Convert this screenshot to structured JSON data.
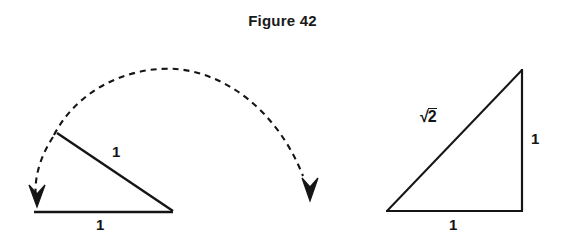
{
  "figure": {
    "title": "Figure 42",
    "background_color": "#ffffff",
    "stroke_color": "#151515",
    "width": 565,
    "height": 247
  },
  "left_diagram": {
    "name": "rotating-unit-segment-diagram",
    "base_label": "1",
    "hypotenuse_label": "1",
    "arc_style": "dashed",
    "arrow_count": 2,
    "arrow_direction": "down",
    "geometry": {
      "base_start_x": 34,
      "base_start_y": 212,
      "base_end_x": 172,
      "base_end_y": 212,
      "slant_start_x": 57,
      "slant_start_y": 133,
      "slant_end_x": 172,
      "slant_end_y": 211,
      "arc_peak_x": 175,
      "arc_peak_y": 70,
      "left_arrow_tip_x": 37,
      "left_arrow_tip_y": 206,
      "right_arrow_tip_x": 310,
      "right_arrow_tip_y": 200
    },
    "labels": [
      {
        "text": "1",
        "x": 112,
        "y": 144,
        "name": "left-hypotenuse-length-label"
      },
      {
        "text": "1",
        "x": 96,
        "y": 217,
        "name": "left-base-length-label"
      }
    ]
  },
  "right_diagram": {
    "name": "right-isosceles-triangle-diagram",
    "base_label": "1",
    "vertical_label": "1",
    "hypotenuse_label": "√2",
    "hypotenuse_radicand": "2",
    "geometry": {
      "left_vertex_x": 387,
      "left_vertex_y": 211,
      "right_vertex_x": 522,
      "right_vertex_y": 211,
      "apex_x": 522,
      "apex_y": 70
    },
    "labels": [
      {
        "text": "1",
        "x": 531,
        "y": 131,
        "name": "right-vertical-length-label"
      },
      {
        "text": "1",
        "x": 449,
        "y": 217,
        "name": "right-base-length-label"
      }
    ]
  }
}
